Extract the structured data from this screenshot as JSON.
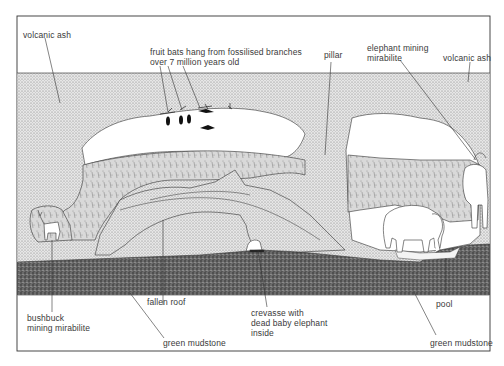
{
  "figure": {
    "type": "cross-section illustration"
  },
  "colors": {
    "background": "#ffffff",
    "frame": "#333333",
    "ash_fill": "#d8d8d8",
    "cave_wall_fill": "#c9c9c9",
    "mudstone_fill": "#5a5a5a",
    "label_text": "#3a3a3a",
    "leader_line": "#333333"
  },
  "labels": {
    "volcanic_ash_left": "volcanic ash",
    "fruit_bats_line1": "fruit bats hang from fossilised branches",
    "fruit_bats_line2": "over 7 million years old",
    "pillar": "pillar",
    "elephant_mining_line1": "elephant mining",
    "elephant_mining_line2": "mirabilite",
    "volcanic_ash_right": "volcanic ash",
    "bushbuck_line1": "bushbuck",
    "bushbuck_line2": "mining mirabilite",
    "fallen_roof": "fallen roof",
    "crevasse_line1": "crevasse with",
    "crevasse_line2": "dead baby elephant",
    "crevasse_line3": "inside",
    "pool": "pool",
    "green_mudstone_center": "green mudstone",
    "green_mudstone_right": "green mudstone"
  },
  "layers": [
    {
      "name": "volcanic ash",
      "position": "upper layer"
    },
    {
      "name": "green mudstone",
      "position": "base layer"
    }
  ]
}
